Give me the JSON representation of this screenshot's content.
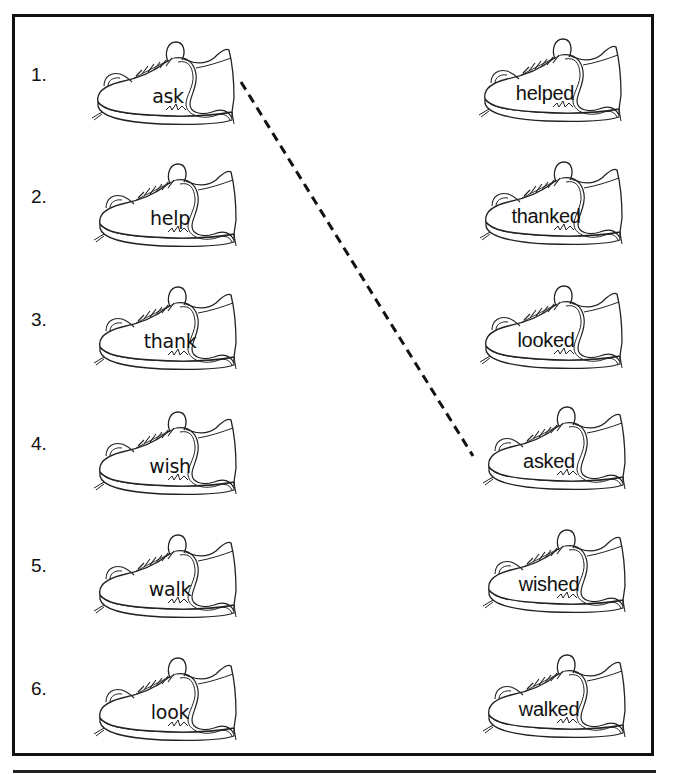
{
  "worksheet": {
    "left_column": [
      {
        "number": "1.",
        "word": "ask"
      },
      {
        "number": "2.",
        "word": "help"
      },
      {
        "number": "3.",
        "word": "thank"
      },
      {
        "number": "4.",
        "word": "wish"
      },
      {
        "number": "5.",
        "word": "walk"
      },
      {
        "number": "6.",
        "word": "look"
      }
    ],
    "right_column": [
      {
        "word": "helped"
      },
      {
        "word": "thanked"
      },
      {
        "word": "looked"
      },
      {
        "word": "asked"
      },
      {
        "word": "wished"
      },
      {
        "word": "walked"
      }
    ],
    "example_match": {
      "from": "ask",
      "to": "asked",
      "style": "dashed"
    },
    "icons": {
      "shoe": "sneaker-icon"
    },
    "colors": {
      "ink": "#111111",
      "paper": "#ffffff"
    }
  }
}
